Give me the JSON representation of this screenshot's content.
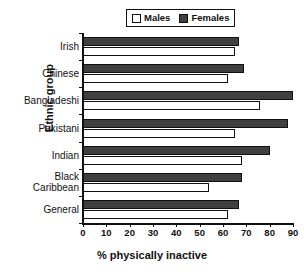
{
  "chart_data": {
    "type": "bar",
    "orientation": "horizontal",
    "title": "",
    "xlabel": "% physically inactive",
    "ylabel": "Ethnic group",
    "xlim": [
      0,
      90
    ],
    "xticks": [
      0,
      10,
      20,
      30,
      40,
      50,
      60,
      70,
      80,
      90
    ],
    "grid": false,
    "legend_position": "top",
    "categories": [
      "Irish",
      "Chinese",
      "Bangladeshi",
      "Pakistani",
      "Indian",
      "Black Caribbean",
      "General"
    ],
    "category_lines": [
      [
        "Irish"
      ],
      [
        "Chinese"
      ],
      [
        "Bangladeshi"
      ],
      [
        "Pakistani"
      ],
      [
        "Indian"
      ],
      [
        "Black",
        "Caribbean"
      ],
      [
        "General"
      ]
    ],
    "series": [
      {
        "name": "Males",
        "color": "#ffffff",
        "values": [
          65,
          62,
          76,
          65,
          68,
          54,
          62
        ]
      },
      {
        "name": "Females",
        "color": "#3f3f3f",
        "values": [
          67,
          69,
          90,
          88,
          80,
          68,
          67
        ]
      }
    ]
  },
  "legend": {
    "entries": [
      {
        "label": "Males",
        "swatch": "males-swatch"
      },
      {
        "label": "Females",
        "swatch": "females-swatch"
      }
    ]
  },
  "axes": {
    "x_title": "% physically inactive",
    "y_title": "Ethnic group",
    "x_tick_labels": [
      "0",
      "10",
      "20",
      "30",
      "40",
      "50",
      "60",
      "70",
      "80",
      "90"
    ]
  }
}
